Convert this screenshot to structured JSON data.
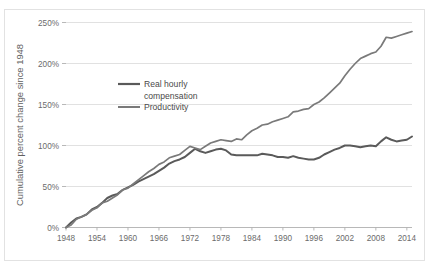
{
  "chart_data": {
    "type": "line",
    "title": "",
    "xlabel": "",
    "ylabel": "Cumulative percent change since 1948",
    "xlim": [
      1948,
      2015
    ],
    "ylim": [
      0,
      250
    ],
    "grid": true,
    "legend_position": "inside-upper-left",
    "y_tick_labels": [
      "0%",
      "50%",
      "100%",
      "150%",
      "200%",
      "250%"
    ],
    "y_tick_values": [
      0,
      50,
      100,
      150,
      200,
      250
    ],
    "x_tick_labels": [
      "1948",
      "1954",
      "1960",
      "1966",
      "1972",
      "1978",
      "1984",
      "1990",
      "1996",
      "2002",
      "2008",
      "2014"
    ],
    "x_tick_values": [
      1948,
      1954,
      1960,
      1966,
      1972,
      1978,
      1984,
      1990,
      1996,
      2002,
      2008,
      2014
    ],
    "series": [
      {
        "name": "Real hourly compensation",
        "color": "#5a5a5a",
        "x": [
          1948,
          1949,
          1950,
          1951,
          1952,
          1953,
          1954,
          1955,
          1956,
          1957,
          1958,
          1959,
          1960,
          1961,
          1962,
          1963,
          1964,
          1965,
          1966,
          1967,
          1968,
          1969,
          1970,
          1971,
          1972,
          1973,
          1974,
          1975,
          1976,
          1977,
          1978,
          1979,
          1980,
          1981,
          1982,
          1983,
          1984,
          1985,
          1986,
          1987,
          1988,
          1989,
          1990,
          1991,
          1992,
          1993,
          1994,
          1995,
          1996,
          1997,
          1998,
          1999,
          2000,
          2001,
          2002,
          2003,
          2004,
          2005,
          2006,
          2007,
          2008,
          2009,
          2010,
          2011,
          2012,
          2013,
          2014,
          2015
        ],
        "values": [
          0,
          6,
          11,
          13,
          16,
          22,
          25,
          30,
          36,
          39,
          41,
          46,
          49,
          52,
          56,
          59,
          62,
          65,
          69,
          73,
          78,
          81,
          83,
          86,
          91,
          96,
          93,
          91,
          93,
          95,
          96,
          94,
          89,
          88,
          88,
          88,
          88,
          88,
          90,
          89,
          88,
          86,
          86,
          85,
          87,
          85,
          84,
          83,
          83,
          85,
          89,
          92,
          95,
          97,
          100,
          100,
          99,
          98,
          99,
          100,
          99,
          105,
          110,
          107,
          105,
          106,
          107,
          111
        ]
      },
      {
        "name": "Productivity",
        "color": "#7a7a7a",
        "x": [
          1948,
          1949,
          1950,
          1951,
          1952,
          1953,
          1954,
          1955,
          1956,
          1957,
          1958,
          1959,
          1960,
          1961,
          1962,
          1963,
          1964,
          1965,
          1966,
          1967,
          1968,
          1969,
          1970,
          1971,
          1972,
          1973,
          1974,
          1975,
          1976,
          1977,
          1978,
          1979,
          1980,
          1981,
          1982,
          1983,
          1984,
          1985,
          1986,
          1987,
          1988,
          1989,
          1990,
          1991,
          1992,
          1993,
          1994,
          1995,
          1996,
          1997,
          1998,
          1999,
          2000,
          2001,
          2002,
          2003,
          2004,
          2005,
          2006,
          2007,
          2008,
          2009,
          2010,
          2011,
          2012,
          2013,
          2014,
          2015
        ],
        "values": [
          0,
          3,
          10,
          13,
          16,
          21,
          24,
          30,
          32,
          36,
          40,
          46,
          48,
          53,
          58,
          63,
          68,
          72,
          77,
          80,
          85,
          87,
          89,
          94,
          99,
          97,
          95,
          99,
          103,
          105,
          107,
          106,
          105,
          108,
          107,
          113,
          118,
          121,
          125,
          126,
          129,
          131,
          133,
          135,
          141,
          142,
          144,
          145,
          150,
          153,
          158,
          164,
          170,
          176,
          185,
          193,
          200,
          206,
          209,
          212,
          214,
          221,
          232,
          231,
          233,
          235,
          237,
          239
        ]
      }
    ],
    "annotations": []
  },
  "legend": {
    "items": [
      {
        "label_line1": "Real hourly",
        "label_line2": "compensation",
        "color": "#5a5a5a"
      },
      {
        "label_line1": "Productivity",
        "label_line2": "",
        "color": "#7a7a7a"
      }
    ]
  }
}
